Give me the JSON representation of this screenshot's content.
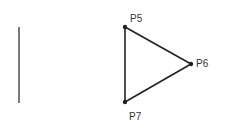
{
  "diagram": {
    "line_color": "#222222",
    "segments": [
      {
        "id": "segment-left",
        "from": "A",
        "to": "B"
      }
    ],
    "points": [
      {
        "id": "P5",
        "label": "P5"
      },
      {
        "id": "P6",
        "label": "P6"
      },
      {
        "id": "P7",
        "label": "P7"
      }
    ],
    "triangle_edges": [
      [
        "P5",
        "P6"
      ],
      [
        "P6",
        "P7"
      ],
      [
        "P7",
        "P5"
      ]
    ]
  }
}
